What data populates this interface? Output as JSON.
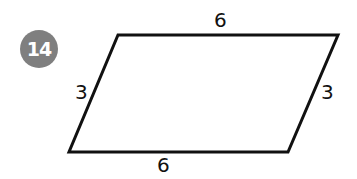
{
  "problem": {
    "number": "14",
    "badge_color": "#7f7f7f"
  },
  "figure": {
    "shape": "parallelogram",
    "vertices": [
      [
        118,
        35
      ],
      [
        338,
        35
      ],
      [
        288,
        152
      ],
      [
        69,
        152
      ]
    ],
    "stroke_color": "#111111",
    "stroke_width": 3,
    "labels": {
      "top": "6",
      "bottom": "6",
      "left": "3",
      "right": "3"
    }
  }
}
